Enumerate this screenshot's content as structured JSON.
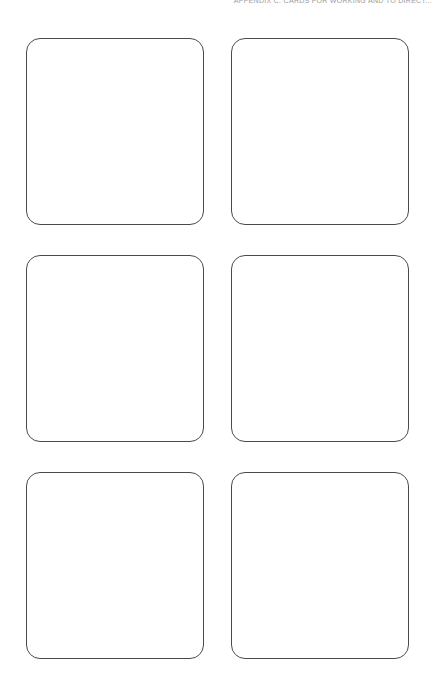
{
  "page": {
    "running_header": "APPENDIX C: CARDS FOR WORKING AND TO DIRECT..."
  },
  "cards": [
    {
      "id": 1,
      "row": 1,
      "column": 1,
      "content": ""
    },
    {
      "id": 2,
      "row": 1,
      "column": 2,
      "content": ""
    },
    {
      "id": 3,
      "row": 2,
      "column": 1,
      "content": ""
    },
    {
      "id": 4,
      "row": 2,
      "column": 2,
      "content": ""
    },
    {
      "id": 5,
      "row": 3,
      "column": 1,
      "content": ""
    },
    {
      "id": 6,
      "row": 3,
      "column": 2,
      "content": ""
    }
  ],
  "colors": {
    "card_border": "#4a4a4a",
    "background": "#ffffff",
    "header_text": "#9a9a9a"
  }
}
